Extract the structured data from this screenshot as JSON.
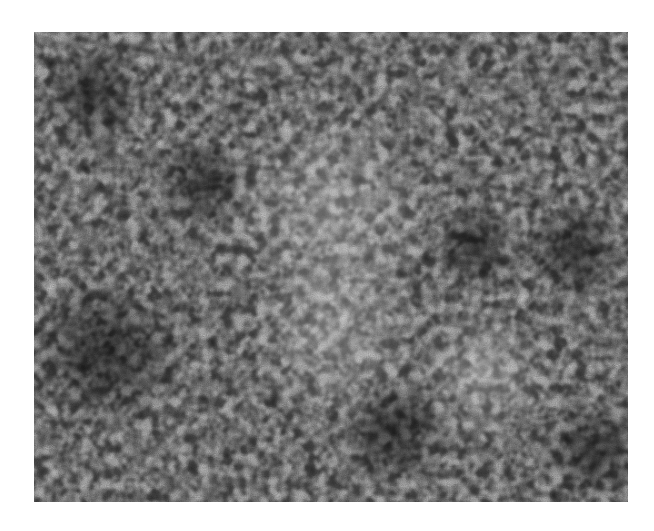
{
  "image": {
    "description": "Grayscale micrograph showing a dense labyrinthine speckle / cellular pattern of light blobs separated by dark interconnected boundaries",
    "tone": "grayscale",
    "colors": {
      "background": "#ffffff",
      "light_blob": "#e8e8e8",
      "dark_boundary": "#2e2e2e",
      "mid_gray": "#8a8a8a"
    },
    "frame": {
      "left": 34,
      "top": 32,
      "width": 594,
      "height": 470
    },
    "dark_regions": [
      {
        "cx": 70,
        "cy": 320,
        "r": 80
      },
      {
        "cx": 360,
        "cy": 400,
        "r": 55
      },
      {
        "cx": 440,
        "cy": 215,
        "r": 45
      },
      {
        "cx": 540,
        "cy": 220,
        "r": 50
      },
      {
        "cx": 60,
        "cy": 60,
        "r": 50
      },
      {
        "cx": 170,
        "cy": 150,
        "r": 45
      },
      {
        "cx": 560,
        "cy": 420,
        "r": 50
      }
    ],
    "light_regions": [
      {
        "cx": 300,
        "cy": 180,
        "r": 110
      },
      {
        "cx": 300,
        "cy": 300,
        "r": 90
      },
      {
        "cx": 450,
        "cy": 340,
        "r": 70
      }
    ]
  }
}
